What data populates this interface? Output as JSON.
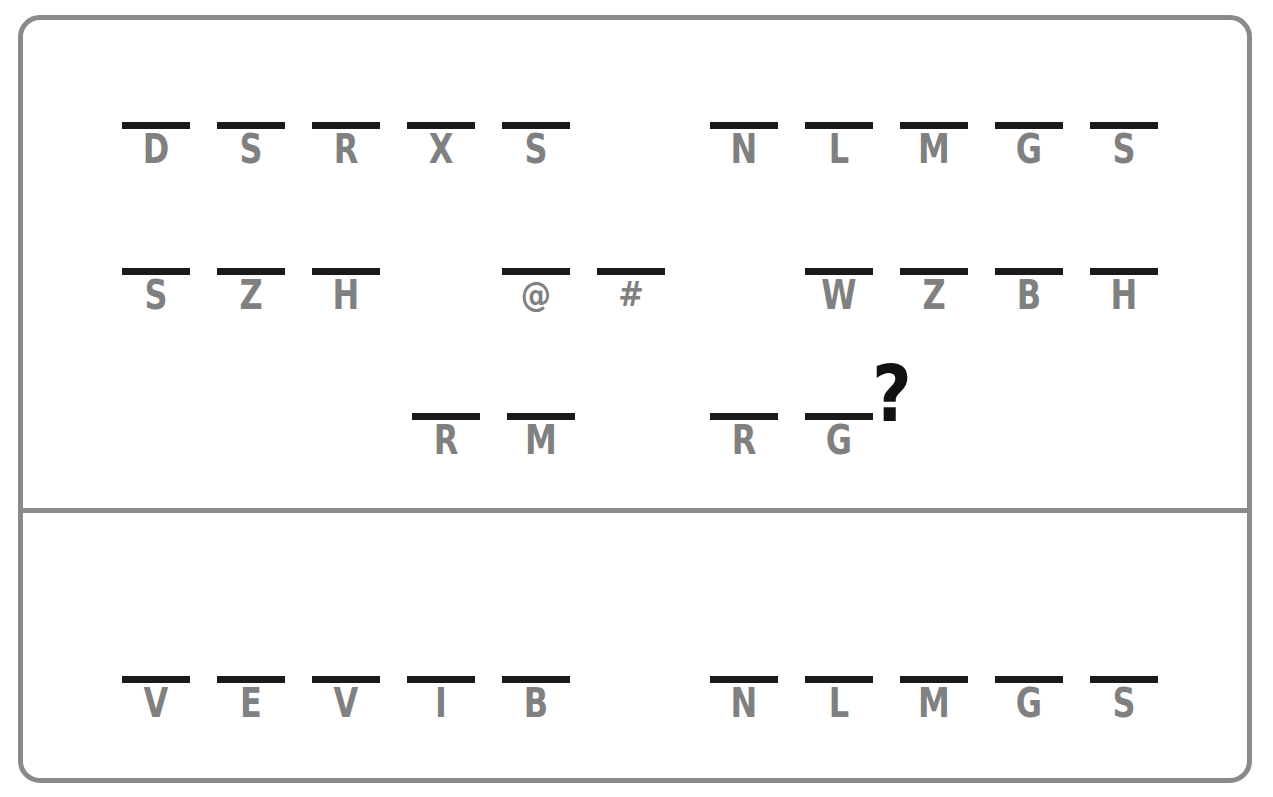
{
  "puzzle": {
    "frame_color": "#8a8a8a",
    "bar_color": "#1a1a1a",
    "glyph_color": "#808080",
    "question_mark_color": "#111111",
    "question_mark": "?",
    "sections": [
      {
        "id": "question",
        "name": "question-section",
        "rows": [
          {
            "id": "row-1",
            "groups": [
              {
                "id": "row-1-group-left",
                "slots": [
                  {
                    "glyph": "D",
                    "state": "filled"
                  },
                  {
                    "glyph": "S",
                    "state": "filled"
                  },
                  {
                    "glyph": "R",
                    "state": "filled"
                  },
                  {
                    "glyph": "X",
                    "state": "filled"
                  },
                  {
                    "glyph": "S",
                    "state": "filled"
                  }
                ]
              },
              {
                "id": "row-1-group-right",
                "slots": [
                  {
                    "glyph": "N",
                    "state": "filled"
                  },
                  {
                    "glyph": "L",
                    "state": "filled"
                  },
                  {
                    "glyph": "M",
                    "state": "filled"
                  },
                  {
                    "glyph": "G",
                    "state": "filled"
                  },
                  {
                    "glyph": "S",
                    "state": "filled"
                  }
                ]
              }
            ]
          },
          {
            "id": "row-2",
            "groups": [
              {
                "id": "row-2-group-left",
                "slots": [
                  {
                    "glyph": "S",
                    "state": "filled"
                  },
                  {
                    "glyph": "Z",
                    "state": "filled"
                  },
                  {
                    "glyph": "H",
                    "state": "filled"
                  },
                  {
                    "glyph": "",
                    "state": "empty"
                  },
                  {
                    "glyph": "@",
                    "state": "symbol"
                  },
                  {
                    "glyph": "#",
                    "state": "symbol"
                  }
                ]
              },
              {
                "id": "row-2-group-right",
                "slots": [
                  {
                    "glyph": "",
                    "state": "empty"
                  },
                  {
                    "glyph": "W",
                    "state": "filled"
                  },
                  {
                    "glyph": "Z",
                    "state": "filled"
                  },
                  {
                    "glyph": "B",
                    "state": "filled"
                  },
                  {
                    "glyph": "H",
                    "state": "filled"
                  }
                ]
              }
            ]
          },
          {
            "id": "row-3",
            "groups": [
              {
                "id": "row-3-group-left",
                "slots": [
                  {
                    "glyph": "",
                    "state": "empty"
                  },
                  {
                    "glyph": "",
                    "state": "empty"
                  },
                  {
                    "glyph": "",
                    "state": "empty"
                  },
                  {
                    "glyph": "R",
                    "state": "filled"
                  },
                  {
                    "glyph": "M",
                    "state": "filled"
                  }
                ]
              },
              {
                "id": "row-3-group-right",
                "slots": [
                  {
                    "glyph": "R",
                    "state": "filled"
                  },
                  {
                    "glyph": "G",
                    "state": "filled"
                  },
                  {
                    "glyph": "",
                    "state": "empty"
                  },
                  {
                    "glyph": "",
                    "state": "empty"
                  },
                  {
                    "glyph": "",
                    "state": "empty"
                  }
                ]
              }
            ]
          }
        ]
      },
      {
        "id": "answer",
        "name": "answer-section",
        "rows": [
          {
            "id": "row-4",
            "groups": [
              {
                "id": "row-4-group-left",
                "slots": [
                  {
                    "glyph": "V",
                    "state": "filled"
                  },
                  {
                    "glyph": "E",
                    "state": "filled"
                  },
                  {
                    "glyph": "V",
                    "state": "filled"
                  },
                  {
                    "glyph": "I",
                    "state": "filled"
                  },
                  {
                    "glyph": "B",
                    "state": "filled"
                  }
                ]
              },
              {
                "id": "row-4-group-right",
                "slots": [
                  {
                    "glyph": "N",
                    "state": "filled"
                  },
                  {
                    "glyph": "L",
                    "state": "filled"
                  },
                  {
                    "glyph": "M",
                    "state": "filled"
                  },
                  {
                    "glyph": "G",
                    "state": "filled"
                  },
                  {
                    "glyph": "S",
                    "state": "filled"
                  }
                ]
              }
            ]
          }
        ]
      }
    ]
  }
}
